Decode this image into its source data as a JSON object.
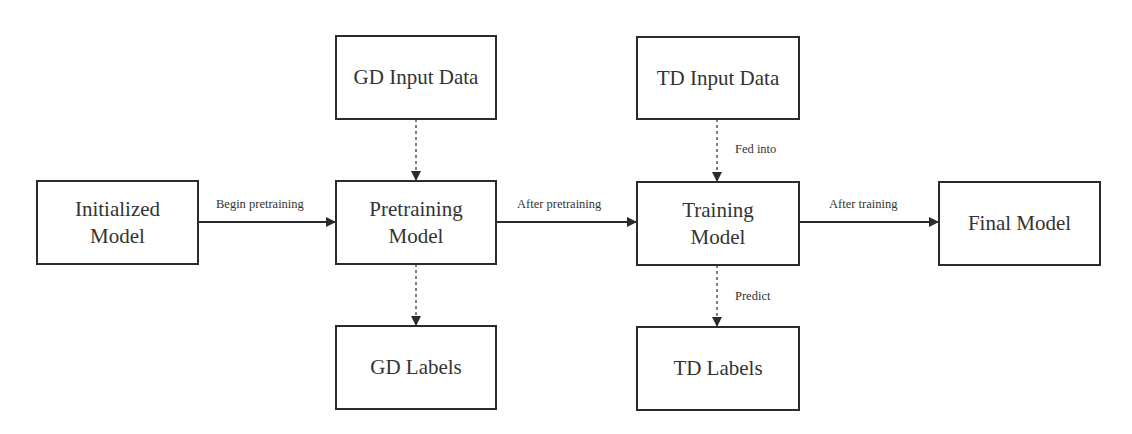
{
  "diagram": {
    "nodes": {
      "initialized_model": "Initialized\nModel",
      "gd_input_data": "GD Input Data",
      "pretraining_model": "Pretraining\nModel",
      "gd_labels": "GD Labels",
      "td_input_data": "TD Input Data",
      "training_model": "Training\nModel",
      "td_labels": "TD Labels",
      "final_model": "Final Model"
    },
    "edges": {
      "begin_pretraining": "Begin pretraining",
      "after_pretraining": "After pretraining",
      "after_training": "After training",
      "fed_into": "Fed into",
      "predict": "Predict"
    },
    "colors": {
      "stroke": "#2b2b2b",
      "text": "#333333",
      "background": "#ffffff"
    }
  }
}
